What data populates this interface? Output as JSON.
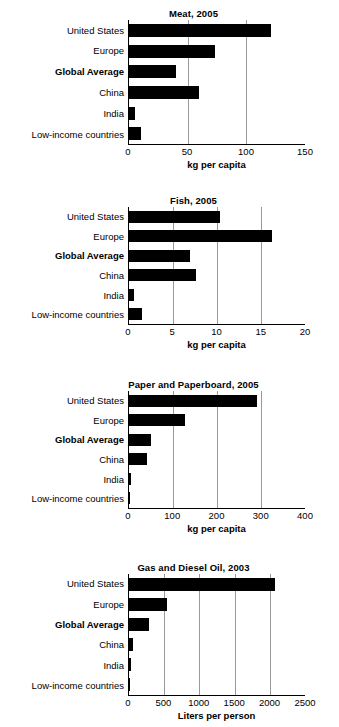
{
  "chart_data": [
    {
      "type": "bar",
      "orientation": "horizontal",
      "title": "Meat, 2005",
      "xlabel": "kg per capita",
      "ylabel": "",
      "categories": [
        "United States",
        "Europe",
        "Global Average",
        "China",
        "India",
        "Low-income countries"
      ],
      "emphasized_category": "Global Average",
      "values": [
        121,
        73,
        40,
        60,
        5,
        10
      ],
      "xlim": [
        0,
        150
      ],
      "xticks": [
        0,
        50,
        100,
        150
      ],
      "xticklabels": [
        "0",
        "50",
        "100",
        "150"
      ],
      "gridlines": [
        50,
        100
      ],
      "grid": true,
      "legend": "none",
      "bar_color": "#000000"
    },
    {
      "type": "bar",
      "orientation": "horizontal",
      "title": "Fish, 2005",
      "xlabel": "kg per capita",
      "ylabel": "",
      "categories": [
        "United States",
        "Europe",
        "Global Average",
        "China",
        "India",
        "Low-income countries"
      ],
      "emphasized_category": "Global Average",
      "values": [
        10.3,
        16.3,
        6.9,
        7.6,
        0.6,
        1.5
      ],
      "xlim": [
        0,
        20
      ],
      "xticks": [
        0,
        5,
        10,
        15,
        20
      ],
      "xticklabels": [
        "0",
        "5",
        "10",
        "15",
        "20"
      ],
      "gridlines": [
        5,
        10,
        15
      ],
      "grid": true,
      "legend": "none",
      "bar_color": "#000000"
    },
    {
      "type": "bar",
      "orientation": "horizontal",
      "title": "Paper and Paperboard, 2005",
      "xlabel": "kg per capita",
      "ylabel": "",
      "categories": [
        "United States",
        "Europe",
        "Global Average",
        "China",
        "India",
        "Low-income countries"
      ],
      "emphasized_category": "Global Average",
      "values": [
        291,
        128,
        50,
        42,
        4,
        3
      ],
      "xlim": [
        0,
        400
      ],
      "xticks": [
        0,
        100,
        200,
        300,
        400
      ],
      "xticklabels": [
        "0",
        "100",
        "200",
        "300",
        "400"
      ],
      "gridlines": [
        100,
        200,
        300
      ],
      "grid": true,
      "legend": "none",
      "bar_color": "#000000"
    },
    {
      "type": "bar",
      "orientation": "horizontal",
      "title": "Gas and Diesel Oil, 2003",
      "xlabel": "Liters per person",
      "ylabel": "",
      "categories": [
        "United States",
        "Europe",
        "Global Average",
        "China",
        "India",
        "Low-income countries"
      ],
      "emphasized_category": "Global Average",
      "values": [
        2080,
        540,
        280,
        60,
        25,
        20
      ],
      "xlim": [
        0,
        2500
      ],
      "xticks": [
        0,
        500,
        1000,
        1500,
        2000,
        2500
      ],
      "xticklabels": [
        "0",
        "500",
        "1000",
        "1500",
        "2000",
        "2500"
      ],
      "gridlines": [
        500,
        1000,
        1500,
        2000
      ],
      "grid": true,
      "legend": "none",
      "bar_color": "#000000"
    }
  ],
  "layout": {
    "panel_heights": [
      125,
      118,
      118,
      122
    ],
    "panel_gaps": [
      24,
      28,
      27
    ],
    "top_offset": 8,
    "bar_thickness_ratio": 0.62
  }
}
